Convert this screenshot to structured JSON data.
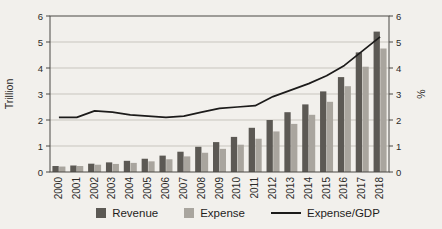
{
  "chart_data": {
    "type": "bar",
    "subtype": "grouped-bars-with-line",
    "title": "",
    "categories": [
      "2000",
      "2001",
      "2002",
      "2003",
      "2004",
      "2005",
      "2006",
      "2007",
      "2008",
      "2009",
      "2010",
      "2011",
      "2012",
      "2013",
      "2014",
      "2015",
      "2016",
      "2017",
      "2018"
    ],
    "series": [
      {
        "name": "Revenue",
        "type": "bar",
        "axis": "left",
        "color": "#5c5954",
        "values": [
          0.23,
          0.25,
          0.32,
          0.37,
          0.43,
          0.51,
          0.63,
          0.78,
          0.97,
          1.15,
          1.35,
          1.7,
          2.0,
          2.3,
          2.6,
          3.1,
          3.65,
          4.6,
          5.4
        ]
      },
      {
        "name": "Expense",
        "type": "bar",
        "axis": "left",
        "color": "#a9a59e",
        "values": [
          0.21,
          0.23,
          0.28,
          0.31,
          0.35,
          0.41,
          0.49,
          0.6,
          0.74,
          0.89,
          1.05,
          1.28,
          1.56,
          1.85,
          2.2,
          2.7,
          3.3,
          4.05,
          4.75
        ]
      },
      {
        "name": "Expense/GDP",
        "type": "line",
        "axis": "right",
        "color": "#1c1b1a",
        "values": [
          2.1,
          2.1,
          2.35,
          2.3,
          2.2,
          2.15,
          2.1,
          2.15,
          2.3,
          2.45,
          2.5,
          2.55,
          2.9,
          3.15,
          3.4,
          3.7,
          4.1,
          4.65,
          5.2
        ]
      }
    ],
    "left_axis": {
      "label": "Trillion",
      "min": 0,
      "max": 6,
      "ticks": [
        "0",
        "1",
        "2",
        "3",
        "4",
        "5",
        "6"
      ]
    },
    "right_axis": {
      "label": "%",
      "min": 0,
      "max": 6,
      "ticks": [
        "0",
        "1",
        "2",
        "3",
        "4",
        "5",
        "6"
      ]
    },
    "grid": "horizontal",
    "legend_position": "bottom",
    "x_tick_rotation_deg": 90
  },
  "style": {
    "paper_bg": "#f2f0ec",
    "grid_color": "#c8c5be",
    "frame_color": "#4a4845",
    "tick_text_color": "#2b2a28"
  }
}
